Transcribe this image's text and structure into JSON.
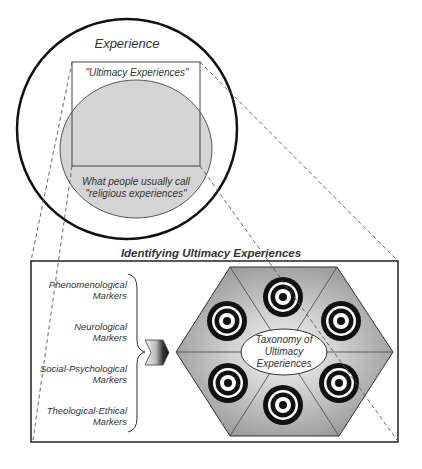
{
  "top_diagram": {
    "outer_circle_label": "Experience",
    "rect_label": "\"Ultimacy Experiences\"",
    "ellipse_label_line1": "What people usually call",
    "ellipse_label_line2": "\"religious experiences\""
  },
  "bottom_panel": {
    "title": "Identifying Ultimacy Experiences",
    "markers": [
      {
        "line1": "Phenomenological",
        "line2": "Markers"
      },
      {
        "line1": "Neurological",
        "line2": "Markers"
      },
      {
        "line1": "Social-Psychological",
        "line2": "Markers"
      },
      {
        "line1": "Theological-Ethical",
        "line2": "Markers"
      }
    ],
    "hexagon_center": {
      "line1": "Taxonomy of",
      "line2": "Ultimacy",
      "line3": "Experiences"
    },
    "target_count": 6
  },
  "colors": {
    "ellipse_fill": "#d4d4d4",
    "hexagon_fill": "#a8a8a8",
    "hexagon_center_glow": "#f2f2f2",
    "stroke": "#222222"
  }
}
